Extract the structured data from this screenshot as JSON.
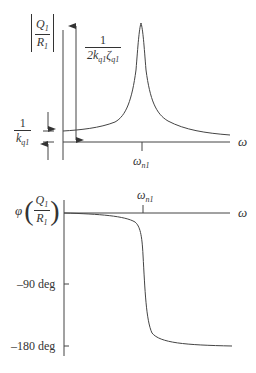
{
  "magnitude_plot": {
    "y_label": {
      "num": "Q",
      "num_sub": "1",
      "den": "R",
      "den_sub": "1"
    },
    "peak_label": {
      "num": "1",
      "den_pre": "2k",
      "den_sub1": "q1",
      "den_mid": "ζ",
      "den_sub2": "q1"
    },
    "dc_label": {
      "num": "1",
      "den": "k",
      "den_sub": "q1"
    },
    "x_axis_label": "ω",
    "tick_label": {
      "main": "ω",
      "sub": "n1"
    }
  },
  "phase_plot": {
    "y_label": {
      "prefix": "φ",
      "num": "Q",
      "num_sub": "1",
      "den": "R",
      "den_sub": "1"
    },
    "x_axis_label": "ω",
    "tick_label": {
      "main": "ω",
      "sub": "n1"
    },
    "y_ticks": [
      "–90 deg",
      "–180 deg"
    ]
  },
  "colors": {
    "line": "#444444",
    "text": "#333333",
    "background": "#ffffff"
  }
}
